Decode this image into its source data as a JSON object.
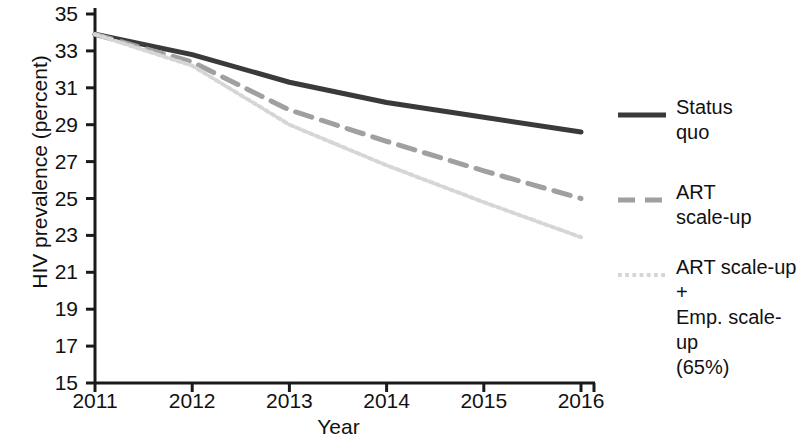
{
  "chart_data": {
    "type": "line",
    "title": "",
    "xlabel": "Year",
    "ylabel": "HIV prevalence (percent)",
    "x": [
      2011,
      2012,
      2013,
      2014,
      2015,
      2016
    ],
    "xticklabels": [
      "2011",
      "2012",
      "2013",
      "2014",
      "2015",
      "2016"
    ],
    "yticklabels": [
      "15",
      "17",
      "19",
      "21",
      "23",
      "25",
      "27",
      "29",
      "31",
      "33",
      "35"
    ],
    "yticks": [
      15,
      17,
      19,
      21,
      23,
      25,
      27,
      29,
      31,
      33,
      35
    ],
    "xlim": [
      2011,
      2016
    ],
    "ylim": [
      15,
      35
    ],
    "grid": false,
    "legend_position": "right",
    "series": [
      {
        "name": "Status quo",
        "label": "Status\nquo",
        "values": [
          33.9,
          32.8,
          31.3,
          30.2,
          29.4,
          28.6
        ],
        "color": "#3a3a3a",
        "style": "solid",
        "width": 5
      },
      {
        "name": "ART scale-up",
        "label": "ART\nscale-up",
        "values": [
          33.9,
          32.4,
          29.8,
          28.1,
          26.5,
          25.0
        ],
        "color": "#a0a0a0",
        "style": "dashed",
        "width": 5
      },
      {
        "name": "ART scale-up + Emp. scale-up (65%)",
        "label": "ART scale-up +\nEmp. scale-up\n(65%)",
        "values": [
          33.9,
          32.2,
          29.0,
          26.8,
          24.8,
          22.9
        ],
        "color": "#d6d6d6",
        "style": "dotted",
        "width": 4
      }
    ]
  },
  "axis": {
    "line_color": "#1a1a1a",
    "tick_length": 9
  }
}
